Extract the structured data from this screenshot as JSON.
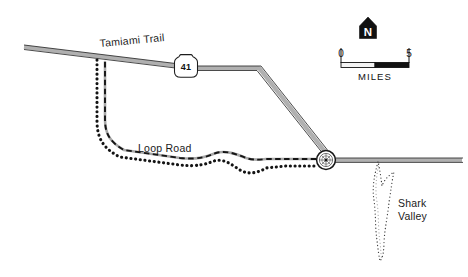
{
  "map": {
    "title": "Shark Valley area map",
    "colors": {
      "ink": "#1a1a1a",
      "road_fill": "#b9b9b9",
      "road_casing": "#3a3a3a",
      "background": "#ffffff",
      "scale_fill_left": "#f2f2f2",
      "scale_fill_right": "#111111"
    },
    "labels": {
      "tamiami_trail": "Tamiami Trail",
      "loop_road": "Loop Road",
      "shark_valley_line1": "Shark",
      "shark_valley_line2": "Valley"
    },
    "route_shield": {
      "name": "us-route-shield",
      "number": "41"
    },
    "north_arrow": {
      "name": "north-arrow",
      "letter": "N"
    },
    "scale_bar": {
      "name": "scale-bar",
      "min": "0",
      "max": "5",
      "units": "MILES"
    },
    "markers": {
      "visitor_center": "visitor-center-marker"
    },
    "features": [
      {
        "id": "tamiami-trail-road",
        "label": "Tamiami Trail",
        "type": "highway"
      },
      {
        "id": "loop-road",
        "label": "Loop Road",
        "type": "unpaved-road"
      },
      {
        "id": "park-boundary",
        "label": "",
        "type": "boundary"
      },
      {
        "id": "shark-valley-trail",
        "label": "Shark Valley",
        "type": "trail-loop"
      }
    ]
  }
}
